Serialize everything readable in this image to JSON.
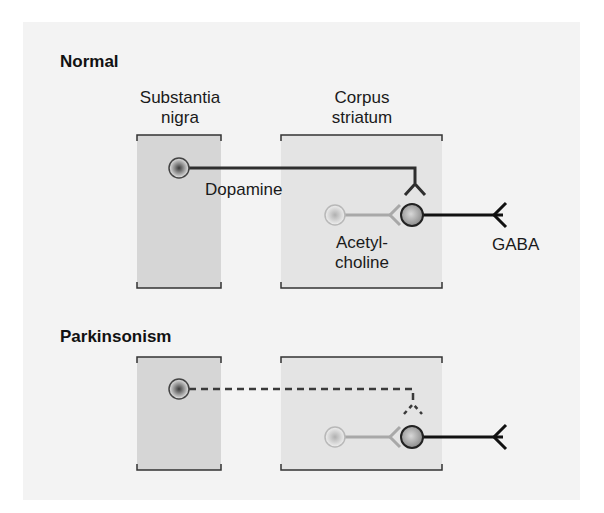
{
  "sections": [
    {
      "heading": "Normal",
      "substantia_nigra_label_line1": "Substantia",
      "substantia_nigra_label_line2": "nigra",
      "corpus_striatum_label_line1": "Corpus",
      "corpus_striatum_label_line2": "striatum",
      "dopamine_label": "Dopamine",
      "acetylcholine_label_line1": "Acetyl-",
      "acetylcholine_label_line2": "choline",
      "gaba_label": "GABA",
      "dopamine_pathway": "intact"
    },
    {
      "heading": "Parkinsonism",
      "dopamine_pathway": "degenerated (dashed)"
    }
  ],
  "colors": {
    "panel_bg": "#f3f3f3",
    "substantia_nigra_box": "#d6d6d6",
    "corpus_striatum_box": "#e4e4e4",
    "dopamine_line": "#2e2e2e",
    "acetylcholine_line": "#a8a8a8",
    "gaba_line": "#111111"
  }
}
